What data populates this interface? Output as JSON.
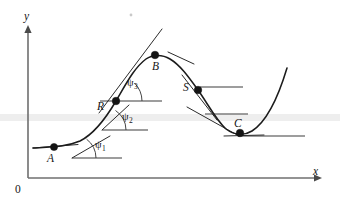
{
  "figure": {
    "kind": "math-diagram",
    "background_color": "#ffffff",
    "curve_color": "#1c1c1c",
    "axis_color": "#6f6f6f",
    "width": 340,
    "height": 209
  },
  "axes": {
    "x_label": "x",
    "y_label": "y",
    "origin_label": "0",
    "x_axis": {
      "x1": 28,
      "y1": 178,
      "x2": 318,
      "y2": 178
    },
    "y_axis": {
      "x1": 28,
      "y1": 178,
      "x2": 28,
      "y2": 29
    }
  },
  "points": [
    {
      "id": "A",
      "label": "A",
      "cx": 54,
      "cy": 147,
      "label_x": 48,
      "label_y": 152,
      "note": "shallow rising segment, small slope"
    },
    {
      "id": "R",
      "label": "R",
      "cx": 116,
      "cy": 101,
      "label_x": 100,
      "label_y": 102,
      "note": "inflection point on rise, steepest slope"
    },
    {
      "id": "B",
      "label": "B",
      "cx": 155,
      "cy": 55,
      "label_x": 154,
      "label_y": 61,
      "note": "maximum, horizontal tangent"
    },
    {
      "id": "S",
      "label": "S",
      "cx": 198,
      "cy": 90,
      "label_x": 185,
      "label_y": 84,
      "note": "inflection point on descent"
    },
    {
      "id": "C",
      "label": "C",
      "cx": 240,
      "cy": 133,
      "label_x": 236,
      "label_y": 120,
      "note": "minimum, horizontal tangent"
    }
  ],
  "angles": [
    {
      "id": "psi1",
      "symbol": "ψ",
      "subscript": "1",
      "label": "ψ1",
      "vertex_x": 72,
      "vertex_y": 158,
      "label_x": 96,
      "label_y": 146,
      "note": "angle of tangent at A with horizontal"
    },
    {
      "id": "psi2",
      "symbol": "ψ",
      "subscript": "2",
      "label": "ψ2",
      "vertex_x": 102,
      "vertex_y": 130,
      "label_x": 123,
      "label_y": 117,
      "note": "angle of tangent at intermediate point"
    },
    {
      "id": "psi3",
      "symbol": "ψ",
      "subscript": "3",
      "label": "ψ3",
      "vertex_x": 116,
      "vertex_y": 101,
      "label_x": 127,
      "label_y": 82,
      "note": "angle of tangent at R, largest of the three"
    }
  ],
  "reference_lines": [
    {
      "id": "ref-psi1",
      "x1": 72,
      "y1": 158,
      "x2": 122,
      "y2": 158
    },
    {
      "id": "ref-psi2",
      "x1": 102,
      "y1": 130,
      "x2": 148,
      "y2": 130
    },
    {
      "id": "ref-psi3",
      "x1": 100,
      "y1": 101,
      "x2": 162,
      "y2": 101
    },
    {
      "id": "ref-S",
      "x1": 200,
      "y1": 87,
      "x2": 243,
      "y2": 87
    },
    {
      "id": "ref-S-lower",
      "x1": 205,
      "y1": 114,
      "x2": 248,
      "y2": 114
    },
    {
      "id": "ref-C",
      "x1": 238,
      "y1": 136,
      "x2": 305,
      "y2": 136
    }
  ],
  "tangent_segments": [
    {
      "id": "tangent-A",
      "x1": 35,
      "y1": 148,
      "x2": 75,
      "y2": 145
    },
    {
      "id": "tangent-psi1",
      "x1": 72,
      "y1": 158,
      "x2": 108,
      "y2": 138
    },
    {
      "id": "tangent-psi2",
      "x1": 102,
      "y1": 130,
      "x2": 128,
      "y2": 106
    },
    {
      "id": "tangent-R-long",
      "x1": 100,
      "y1": 112,
      "x2": 161,
      "y2": 30
    },
    {
      "id": "tangent-B",
      "x1": 168,
      "y1": 53,
      "x2": 192,
      "y2": 62
    },
    {
      "id": "tangent-S",
      "x1": 183,
      "y1": 76,
      "x2": 216,
      "y2": 119
    },
    {
      "id": "tangent-S-2",
      "x1": 188,
      "y1": 108,
      "x2": 238,
      "y2": 135
    },
    {
      "id": "tangent-C",
      "x1": 226,
      "y1": 136,
      "x2": 262,
      "y2": 135
    }
  ]
}
